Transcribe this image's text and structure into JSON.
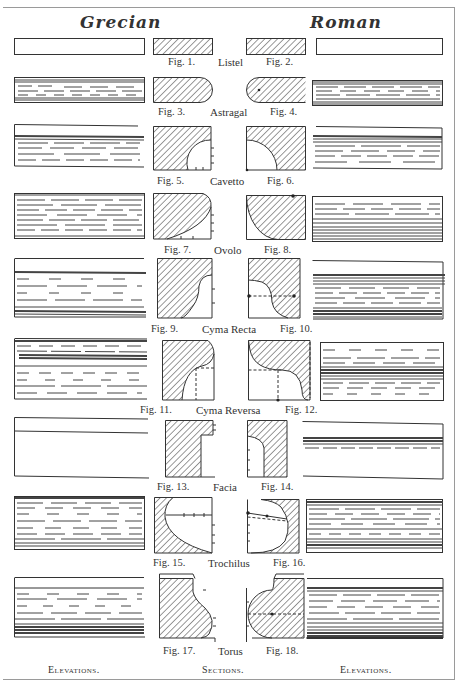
{
  "headings": {
    "left": "Grecian",
    "right": "Roman"
  },
  "colors": {
    "ink": "#222222",
    "paper": "#ffffff",
    "border": "#9a9a9a"
  },
  "rows": [
    {
      "name": "Listel",
      "left_fig": "Fig. 1.",
      "right_fig": "Fig. 2."
    },
    {
      "name": "Astragal",
      "left_fig": "Fig. 3.",
      "right_fig": "Fig. 4."
    },
    {
      "name": "Cavetto",
      "left_fig": "Fig. 5.",
      "right_fig": "Fig. 6."
    },
    {
      "name": "Ovolo",
      "left_fig": "Fig. 7.",
      "right_fig": "Fig. 8."
    },
    {
      "name": "Cyma Recta",
      "left_fig": "Fig. 9.",
      "right_fig": "Fig. 10."
    },
    {
      "name": "Cyma Reversa",
      "left_fig": "Fig. 11.",
      "right_fig": "Fig. 12."
    },
    {
      "name": "Facia",
      "left_fig": "Fig. 13.",
      "right_fig": "Fig. 14."
    },
    {
      "name": "Trochilus",
      "left_fig": "Fig. 15.",
      "right_fig": "Fig. 16."
    },
    {
      "name": "Torus",
      "left_fig": "Fig. 17.",
      "right_fig": "Fig. 18."
    }
  ],
  "footer": {
    "left": "Elevations.",
    "center": "Sections.",
    "right": "Elevations."
  }
}
